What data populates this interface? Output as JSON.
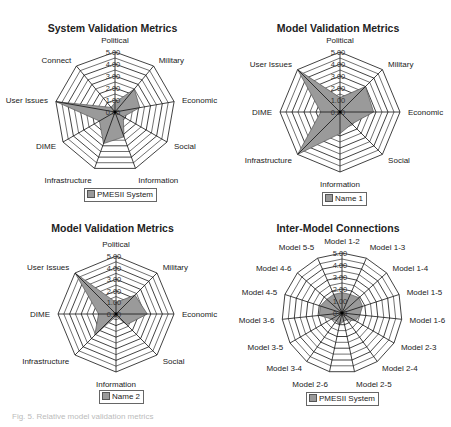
{
  "figure": {
    "caption": "Fig. 5. Relative model validation metrics"
  },
  "colors": {
    "fill": "#9a9a9a",
    "grid": "#111111",
    "legend_swatch": "#999999"
  },
  "chart_data": [
    {
      "type": "radar",
      "title": "System Validation Metrics",
      "axes": [
        "Political",
        "Military",
        "Economic",
        "Social",
        "Information",
        "Infrastructure",
        "DIME",
        "User Issues",
        "Connect"
      ],
      "series": [
        {
          "name": "PMESII System",
          "values": [
            0.8,
            2.5,
            2.1,
            0.8,
            2.2,
            2.8,
            1.5,
            5.0,
            0.5
          ]
        }
      ],
      "tick_labels": [
        "0.00",
        "1.00",
        "2.00",
        "3.00",
        "4.00",
        "5.00"
      ],
      "range": [
        0,
        5
      ],
      "grid": true,
      "legend_position": "bottom"
    },
    {
      "type": "radar",
      "title": "Model Validation Metrics",
      "axes": [
        "Political",
        "Military",
        "Economic",
        "Social",
        "Information",
        "Infrastructure",
        "DIME",
        "User Issues"
      ],
      "series": [
        {
          "name": "Name 1",
          "values": [
            1.2,
            3.0,
            2.8,
            1.4,
            1.8,
            5.0,
            1.6,
            5.0
          ]
        }
      ],
      "tick_labels": [
        "0.00",
        "1.00",
        "2.00",
        "3.00",
        "4.00",
        "5.00"
      ],
      "range": [
        0,
        5
      ],
      "grid": true,
      "legend_position": "bottom"
    },
    {
      "type": "radar",
      "title": "Model Validation Metrics",
      "axes": [
        "Political",
        "Military",
        "Economic",
        "Social",
        "Information",
        "Infrastructure",
        "DIME",
        "User Issues"
      ],
      "series": [
        {
          "name": "Name 2",
          "values": [
            1.0,
            2.3,
            2.7,
            1.3,
            0.2,
            2.6,
            1.5,
            5.0
          ]
        }
      ],
      "tick_labels": [
        "0.00",
        "1.00",
        "2.00",
        "3.00",
        "4.00",
        "5.00"
      ],
      "range": [
        0,
        5
      ],
      "grid": true,
      "legend_position": "bottom"
    },
    {
      "type": "radar",
      "title": "Inter-Model Connections",
      "axes": [
        "Model 1-2",
        "Model 1-3",
        "Model 1-4",
        "Model 1-5",
        "Model 1-6",
        "Model 2-3",
        "Model 2-4",
        "Model 2-5",
        "Model 2-6",
        "Model 3-4",
        "Model 3-5",
        "Model 3-6",
        "Model 4-5",
        "Model 4-6",
        "Model 5-5"
      ],
      "series": [
        {
          "name": "PMESII System",
          "values": [
            1.7,
            1.7,
            1.9,
            1.8,
            1.5,
            1.3,
            0.7,
            0.7,
            1.0,
            0.8,
            1.0,
            1.9,
            1.9,
            1.7,
            1.7
          ]
        }
      ],
      "tick_labels": [
        "0.00",
        "1.00",
        "2.00",
        "3.00",
        "4.00",
        "5.00"
      ],
      "range": [
        0,
        5
      ],
      "grid": true,
      "legend_position": "bottom"
    }
  ]
}
